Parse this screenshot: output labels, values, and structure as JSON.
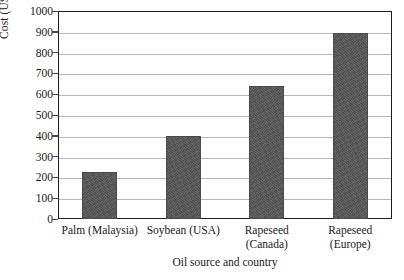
{
  "chart_data": {
    "type": "bar",
    "title": "",
    "xlabel": "Oil source and country",
    "ylabel": "Cost (USD/ton)",
    "categories": [
      [
        "Palm (Malaysia)"
      ],
      [
        "Soybean (USA)"
      ],
      [
        "Rapeseed",
        "(Canada)"
      ],
      [
        "Rapeseed",
        "(Europe)"
      ]
    ],
    "values": [
      225,
      400,
      640,
      895
    ],
    "ylim": [
      0,
      1000
    ],
    "ytick_labels": [
      "1000",
      "900",
      "800",
      "700",
      "600",
      "500",
      "400",
      "300",
      "200",
      "100",
      "0"
    ],
    "ytick_values": [
      1000,
      900,
      800,
      700,
      600,
      500,
      400,
      300,
      200,
      100,
      0
    ],
    "grid": true,
    "legend": false,
    "legend_position": "none",
    "bar_color": "#555555",
    "frame_color": "#1d1d1d",
    "gridline_color": "#b9b9b9"
  },
  "figure": {
    "caption": ""
  }
}
